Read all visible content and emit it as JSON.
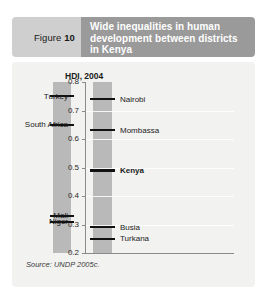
{
  "header": {
    "figure_label": "Figure",
    "figure_number": "10",
    "title": "Wide inequalities in human development between districts in Kenya"
  },
  "source_note": "Source: UNDP 2005c.",
  "chart_data": {
    "type": "scatter",
    "title": "Wide inequalities in human development between districts in Kenya",
    "axis_title": "HDI, 2004",
    "xlabel": "",
    "ylabel": "HDI, 2004",
    "ylim": [
      0.2,
      0.8
    ],
    "grid": true,
    "legend": "none",
    "ticks": [
      "0.8",
      "0.7",
      "0.6",
      "0.5",
      "0.4",
      "0.3",
      "0.2"
    ],
    "tick_values": [
      0.8,
      0.7,
      0.6,
      0.5,
      0.4,
      0.3,
      0.2
    ],
    "series": [
      {
        "name": "Comparator countries",
        "side": "left",
        "points": [
          {
            "label": "Turkey",
            "value": 0.75,
            "bold": false
          },
          {
            "label": "South Africa",
            "value": 0.65,
            "bold": false
          },
          {
            "label": "Mali",
            "value": 0.33,
            "bold": false
          },
          {
            "label": "Niger",
            "value": 0.31,
            "bold": false
          }
        ]
      },
      {
        "name": "Kenya and districts",
        "side": "right",
        "points": [
          {
            "label": "Nairobi",
            "value": 0.74,
            "bold": false
          },
          {
            "label": "Mombassa",
            "value": 0.63,
            "bold": false
          },
          {
            "label": "Kenya",
            "value": 0.49,
            "bold": true
          },
          {
            "label": "Busia",
            "value": 0.29,
            "bold": false
          },
          {
            "label": "Turkana",
            "value": 0.25,
            "bold": false
          }
        ]
      }
    ]
  },
  "colors": {
    "header_left_bg": "#cfcfcf",
    "header_right_bg": "#9a9a9a",
    "panel_bg": "#f2f2f0",
    "bar_fill": "#b9b9b9",
    "marker": "#111111",
    "axis": "#8a8a8a"
  }
}
